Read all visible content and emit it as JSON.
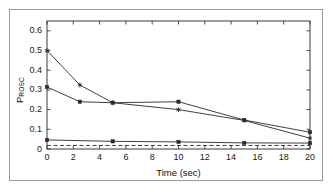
{
  "figure": {
    "background": "#ffffff",
    "frame_color": "#9a9a9a",
    "axis_color": "#3a3a3a"
  },
  "axis_titles": {
    "x": "Time (sec)",
    "y_main": "P",
    "y_sub": "ROSC"
  },
  "chart_data": {
    "type": "line",
    "title": "",
    "xlabel": "Time (sec)",
    "ylabel": "P_ROSC",
    "xlim": [
      0,
      20
    ],
    "ylim": [
      0,
      0.65
    ],
    "xticks": [
      0,
      2,
      4,
      6,
      8,
      10,
      12,
      14,
      16,
      18,
      20
    ],
    "xtick_labels": [
      "0",
      "2",
      "4",
      "6",
      "8",
      "10",
      "12",
      "14",
      "16",
      "18",
      "20"
    ],
    "yticks": [
      0,
      0.1,
      0.2,
      0.3,
      0.4,
      0.5,
      0.6
    ],
    "ytick_labels": [
      "0",
      "0.1",
      "0.2",
      "0.3",
      "0.4",
      "0.5",
      "0.6"
    ],
    "grid": false,
    "legend": null,
    "series": [
      {
        "name": "series-1",
        "style": "solid",
        "marker": "star",
        "color": "#2a2a2a",
        "x": [
          0,
          2.5,
          5,
          10,
          15,
          20
        ],
        "values": [
          0.5,
          0.325,
          0.235,
          0.2,
          0.145,
          0.055
        ]
      },
      {
        "name": "series-2",
        "style": "solid",
        "marker": "square",
        "color": "#2a2a2a",
        "x": [
          0,
          2.5,
          5,
          10,
          15,
          20
        ],
        "values": [
          0.315,
          0.24,
          0.235,
          0.24,
          0.147,
          0.085
        ]
      },
      {
        "name": "series-3",
        "style": "solid",
        "marker": "square",
        "color": "#2a2a2a",
        "x": [
          0,
          5,
          10,
          15,
          20
        ],
        "values": [
          0.046,
          0.039,
          0.036,
          0.031,
          0.03
        ]
      },
      {
        "name": "series-4",
        "style": "dashed",
        "marker": "none",
        "color": "#2a2a2a",
        "x": [
          0,
          20
        ],
        "values": [
          0.018,
          0.018
        ]
      }
    ]
  }
}
